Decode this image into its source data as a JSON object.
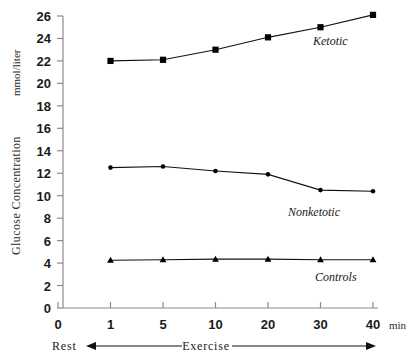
{
  "chart_data": {
    "type": "line",
    "title": "",
    "xlabel": "min",
    "ylabel": "Glucose Concentration",
    "yunit": "mmol/liter",
    "categories": [
      "0",
      "1",
      "5",
      "10",
      "20",
      "30",
      "40"
    ],
    "x_tick_labels": [
      "0",
      "1",
      "5",
      "10",
      "20",
      "30",
      "40"
    ],
    "y_tick_labels": [
      "0",
      "2",
      "4",
      "6",
      "8",
      "10",
      "12",
      "14",
      "16",
      "18",
      "20",
      "22",
      "24",
      "26"
    ],
    "ylim": [
      0,
      26
    ],
    "grid": false,
    "legend_position": "inline-right",
    "series": [
      {
        "name": "Ketotic",
        "marker": "square",
        "x": [
          "1",
          "5",
          "10",
          "20",
          "30",
          "40"
        ],
        "values": [
          22.0,
          22.1,
          23.0,
          24.1,
          25.0,
          26.1
        ]
      },
      {
        "name": "Nonketotic",
        "marker": "diamond",
        "x": [
          "1",
          "5",
          "10",
          "20",
          "30",
          "40"
        ],
        "values": [
          12.5,
          12.6,
          12.2,
          11.9,
          10.5,
          10.4
        ]
      },
      {
        "name": "Controls",
        "marker": "triangle",
        "x": [
          "1",
          "5",
          "10",
          "20",
          "30",
          "40"
        ],
        "values": [
          4.25,
          4.3,
          4.35,
          4.35,
          4.3,
          4.3
        ]
      }
    ],
    "annotations": [
      {
        "text": "Rest",
        "role": "phase-left"
      },
      {
        "text": "Exercise",
        "role": "phase-right"
      }
    ]
  },
  "axis": {
    "y_title": "Glucose Concentration",
    "y_unit": "mmol/liter",
    "x_unit": "min"
  },
  "phases": {
    "rest": "Rest",
    "exercise": "Exercise"
  },
  "series_labels": {
    "ketotic": "Ketotic",
    "nonketotic": "Nonketotic",
    "controls": "Controls"
  },
  "colors": {
    "line": "#111111",
    "marker": "#000000",
    "axis": "#8a8a8a",
    "text": "#1a1a1a",
    "background": "#ffffff"
  }
}
